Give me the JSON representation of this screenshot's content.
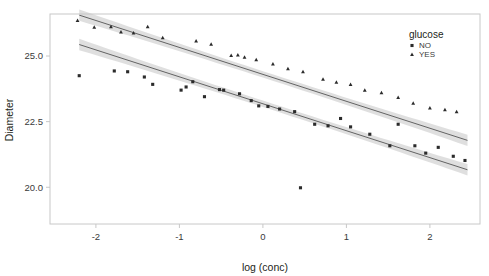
{
  "chart_data": {
    "type": "scatter",
    "title": "",
    "xlabel": "log (conc)",
    "ylabel": "Diameter",
    "xlim": [
      -2.55,
      2.6
    ],
    "ylim": [
      18.6,
      26.6
    ],
    "xticks": [
      -2,
      -1,
      0,
      1,
      2
    ],
    "xticklabels": [
      "-2",
      "-1",
      "0",
      "1",
      "2"
    ],
    "yticks": [
      20.0,
      22.5,
      25.0
    ],
    "yticklabels": [
      "20.0",
      "22.5",
      "25.0"
    ],
    "grid": false,
    "legend": {
      "title": "glucose",
      "position": "top-right",
      "entries": [
        {
          "label": "NO",
          "marker": "plus-marker",
          "color": "#2b2b2b"
        },
        {
          "label": "YES",
          "marker": "triangle-marker",
          "color": "#2b2b2b"
        }
      ]
    },
    "marker_color": "#2b2b2b",
    "line_color": "#555555",
    "band_color": "#d9d9d9",
    "frame_color": "#c8c8c8",
    "background": "#ffffff",
    "series": [
      {
        "name": "NO",
        "marker": "plus-marker",
        "fit": {
          "type": "linear",
          "intercept": 23.18,
          "slope": -1.026,
          "band_halfwidth": 0.17,
          "x_start": -2.2,
          "x_end": 2.45
        },
        "points": [
          {
            "x": -2.2,
            "y": 24.25
          },
          {
            "x": -1.78,
            "y": 24.43
          },
          {
            "x": -1.62,
            "y": 24.4
          },
          {
            "x": -1.42,
            "y": 24.2
          },
          {
            "x": -1.32,
            "y": 23.92
          },
          {
            "x": -0.98,
            "y": 23.7
          },
          {
            "x": -0.92,
            "y": 23.82
          },
          {
            "x": -0.84,
            "y": 24.02
          },
          {
            "x": -0.7,
            "y": 23.45
          },
          {
            "x": -0.52,
            "y": 23.72
          },
          {
            "x": -0.47,
            "y": 23.7
          },
          {
            "x": -0.28,
            "y": 23.56
          },
          {
            "x": -0.14,
            "y": 23.3
          },
          {
            "x": -0.05,
            "y": 23.1
          },
          {
            "x": 0.06,
            "y": 23.08
          },
          {
            "x": 0.2,
            "y": 22.98
          },
          {
            "x": 0.38,
            "y": 22.88
          },
          {
            "x": 0.45,
            "y": 19.98
          },
          {
            "x": 0.62,
            "y": 22.4
          },
          {
            "x": 0.78,
            "y": 22.34
          },
          {
            "x": 0.93,
            "y": 22.62
          },
          {
            "x": 1.05,
            "y": 22.3
          },
          {
            "x": 1.28,
            "y": 22.02
          },
          {
            "x": 1.52,
            "y": 21.58
          },
          {
            "x": 1.62,
            "y": 22.4
          },
          {
            "x": 1.82,
            "y": 21.58
          },
          {
            "x": 1.95,
            "y": 21.3
          },
          {
            "x": 2.1,
            "y": 21.52
          },
          {
            "x": 2.28,
            "y": 21.18
          },
          {
            "x": 2.42,
            "y": 21.02
          }
        ]
      },
      {
        "name": "YES",
        "marker": "triangle-marker",
        "fit": {
          "type": "linear",
          "intercept": 24.3,
          "slope": -1.026,
          "band_halfwidth": 0.17,
          "x_start": -2.2,
          "x_end": 2.45
        },
        "points": [
          {
            "x": -2.22,
            "y": 26.36
          },
          {
            "x": -2.02,
            "y": 26.1
          },
          {
            "x": -1.82,
            "y": 26.12
          },
          {
            "x": -1.7,
            "y": 25.92
          },
          {
            "x": -1.55,
            "y": 25.88
          },
          {
            "x": -1.38,
            "y": 26.12
          },
          {
            "x": -1.2,
            "y": 25.7
          },
          {
            "x": -0.8,
            "y": 25.58
          },
          {
            "x": -0.62,
            "y": 25.45
          },
          {
            "x": -0.38,
            "y": 25.02
          },
          {
            "x": -0.3,
            "y": 25.04
          },
          {
            "x": -0.22,
            "y": 24.96
          },
          {
            "x": -0.08,
            "y": 24.86
          },
          {
            "x": 0.12,
            "y": 24.7
          },
          {
            "x": 0.3,
            "y": 24.52
          },
          {
            "x": 0.48,
            "y": 24.4
          },
          {
            "x": 0.72,
            "y": 24.12
          },
          {
            "x": 0.88,
            "y": 24.0
          },
          {
            "x": 1.05,
            "y": 23.92
          },
          {
            "x": 1.22,
            "y": 23.7
          },
          {
            "x": 1.42,
            "y": 23.6
          },
          {
            "x": 1.62,
            "y": 23.42
          },
          {
            "x": 1.8,
            "y": 23.2
          },
          {
            "x": 2.0,
            "y": 23.02
          },
          {
            "x": 2.18,
            "y": 22.96
          },
          {
            "x": 2.32,
            "y": 22.88
          }
        ]
      }
    ]
  }
}
